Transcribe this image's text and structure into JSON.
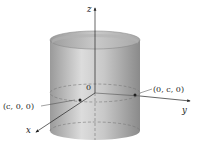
{
  "diagram": {
    "type": "3d-cylinder-with-axes",
    "axes": {
      "z": {
        "label": "z"
      },
      "y": {
        "label": "y"
      },
      "x": {
        "label": "x"
      }
    },
    "origin_label": "0",
    "points": [
      {
        "name": "point-c-0-0",
        "label": "(c, 0, 0)"
      },
      {
        "name": "point-0-c-0",
        "label": "(0, c, 0)"
      }
    ],
    "colors": {
      "cylinder_dark": "#8e8e8e",
      "cylinder_light": "#d9d9d9",
      "inner_top": "#bdbdbd",
      "axis": "#222222",
      "dashed": "#7a7a7a",
      "background": "#ffffff"
    }
  }
}
